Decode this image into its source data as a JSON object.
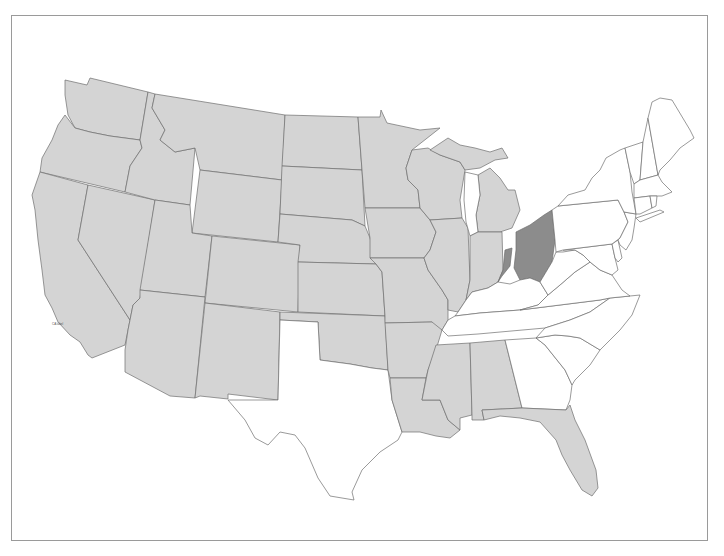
{
  "map": {
    "type": "choropleth",
    "region": "Contiguous United States",
    "colors": {
      "shaded_light": "#d4d4d4",
      "shaded_dark": "#8c8c8c",
      "unshaded": "#ffffff",
      "border": "#6e6e6e",
      "frame": "#9a9a9a"
    },
    "states": {
      "WA": "light",
      "OR": "light",
      "CA": "light",
      "ID": "light",
      "NV": "light",
      "MT": "light",
      "WY": "light",
      "UT": "light",
      "AZ": "light",
      "CO": "light",
      "NM": "light",
      "ND": "light",
      "SD": "light",
      "NE": "light",
      "KS": "light",
      "OK": "light",
      "MN": "light",
      "IA": "light",
      "MO": "light",
      "AR": "light",
      "LA": "light",
      "WI": "light",
      "IL": "light",
      "MI": "light",
      "IN": "light",
      "MS": "light",
      "AL": "light",
      "FL": "light",
      "OH": "dark",
      "IN_SE": "dark",
      "TX": "white",
      "KY": "white",
      "TN": "white",
      "GA": "white",
      "SC": "white",
      "NC": "white",
      "VA": "white",
      "WV": "white",
      "MD": "white",
      "DE": "white",
      "PA": "white",
      "NJ": "white",
      "NY": "white",
      "CT": "white",
      "RI": "white",
      "MA": "white",
      "VT": "white",
      "NH": "white",
      "ME": "white"
    },
    "annotation": "CA label"
  }
}
